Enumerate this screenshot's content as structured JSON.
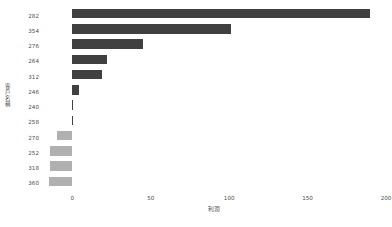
{
  "chart_data": {
    "type": "bar",
    "orientation": "horizontal",
    "title": "",
    "subtitle": "",
    "xlabel": "利潤",
    "ylabel": "客戶名稱",
    "categories": [
      "282",
      "354",
      "276",
      "264",
      "312",
      "246",
      "240",
      "258",
      "270",
      "252",
      "318",
      "360"
    ],
    "values": [
      190,
      101,
      45,
      22,
      19,
      4,
      0.6,
      0.5,
      -10,
      -14,
      -14.5,
      -15
    ],
    "xlim": [
      -20,
      200
    ],
    "ylim": null,
    "xticks": [
      0,
      50,
      100,
      150,
      200
    ],
    "xticklabels": [
      "0",
      "50",
      "100",
      "150",
      "200"
    ],
    "grid": false,
    "legend": null,
    "bar_colors": {
      "positive": "#404040",
      "negative": "#b0b0b0"
    },
    "series": [
      {
        "name": "利潤",
        "values": [
          190,
          101,
          45,
          22,
          19,
          4,
          0.6,
          0.5,
          -10,
          -14,
          -14.5,
          -15
        ]
      }
    ]
  },
  "axes": {
    "x_title": "利潤",
    "y_title": "客戶名稱",
    "x_tick_labels": [
      "0",
      "50",
      "100",
      "150",
      "200"
    ],
    "y_tick_labels": [
      "282",
      "354",
      "276",
      "264",
      "312",
      "246",
      "240",
      "258",
      "270",
      "252",
      "318",
      "360"
    ]
  },
  "colors": {
    "background": "#ffffff",
    "text": "#4d4d4d",
    "bar_positive": "#404040",
    "bar_negative": "#b0b0b0"
  }
}
